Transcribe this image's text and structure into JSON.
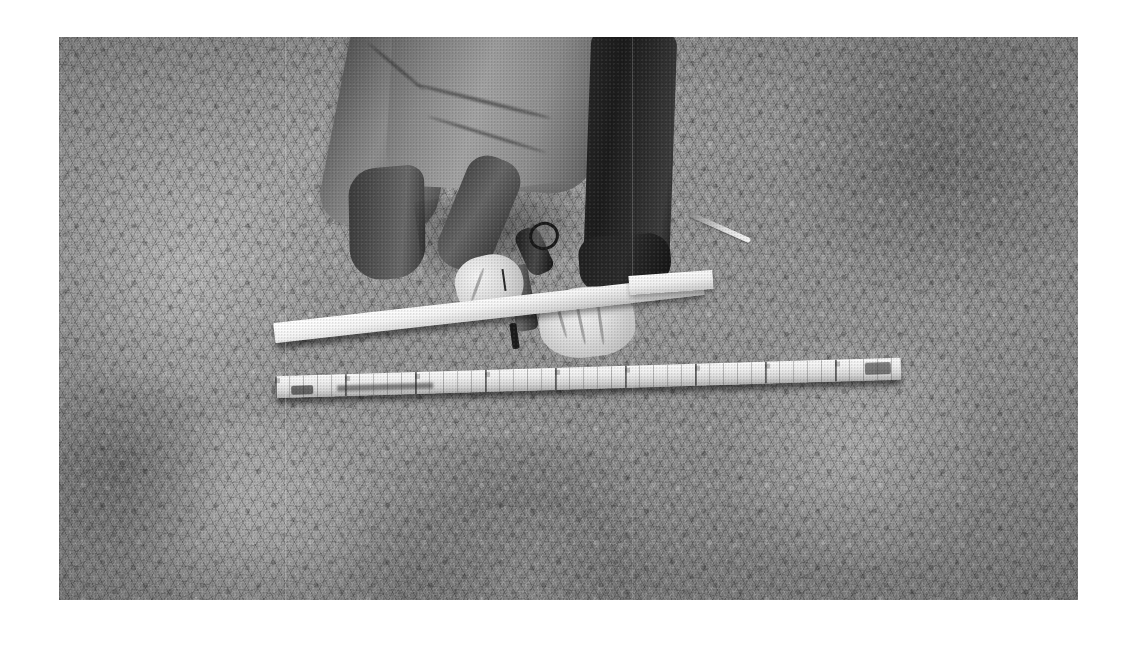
{
  "image": {
    "kind": "photograph",
    "color_mode": "black-and-white",
    "border_color": "#ffffff",
    "canvas": {
      "width": 1137,
      "height": 645
    },
    "photo_frame": {
      "left": 59,
      "top": 37,
      "width": 1019,
      "height": 563
    },
    "scene_description": "Overhead black-and-white photograph of a person crouching on dry grass, sawing a white wooden lath, with a long folding measuring stick lying on the ground below.",
    "tones": {
      "ground_mid": "#9a9a9a",
      "ground_dark": "#6f6f6f",
      "ground_light": "#c4c4c4",
      "lath_white": "#fbfbfb",
      "pants_light": "#9a9a9a",
      "pants_dark": "#262626",
      "skin": "#e8e8e8",
      "tool_dark": "#1c1c1c"
    }
  },
  "subjects": {
    "person": {
      "name": "crouching-person",
      "pose": "crouched / kneeling, viewed from above and behind",
      "upper_garment": "dark long-sleeve top",
      "lower_garment": "light grey trousers",
      "footwear": "dark boot",
      "visible_parts": [
        "hips",
        "left thigh",
        "left shin",
        "right leg",
        "boot",
        "left forearm",
        "left hand",
        "right hand"
      ]
    },
    "tool": {
      "name": "hand-saw",
      "description": "small dark-handled hand saw held in the left hand, blade pressed against the lath"
    },
    "lath": {
      "name": "white-wooden-lath",
      "description": "long pale wooden lath/batten being cut; a short off-cut stub lies beyond the cut line"
    },
    "ruler": {
      "name": "folding-measuring-stick",
      "description": "long folding carpenter's rule / measuring stick laid flat on the grass with graduation marks and faint printed text"
    },
    "twig": {
      "name": "loose-twig",
      "description": "small pale twig lying on the grass to the upper right"
    },
    "ground": {
      "name": "grass-ground",
      "description": "dense dry grass covering the whole frame"
    }
  }
}
